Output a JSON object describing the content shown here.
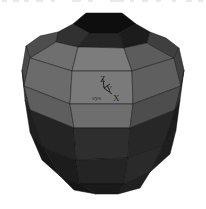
{
  "viewport": {
    "background_color": "#ffffff",
    "width": 206,
    "height": 209,
    "render_mode": "shaded-faceted"
  },
  "model": {
    "name": "geodesic-polyhedron",
    "description": "Faceted grayscale sphere / geodesic polyhedron",
    "center_x": 103,
    "center_y": 102,
    "radius_x": 82,
    "radius_y": 93,
    "shading": {
      "top_cap": "#151515",
      "upper_dark": "#2b2b2b",
      "upper_mid": "#4a4a4a",
      "bright_band": "#7d7d7d",
      "mid_band": "#6a6a6a",
      "left_shade": "#4f4f4f",
      "right_shade": "#555555",
      "lower_dark": "#262626",
      "bottom": "#1b1b1b",
      "edge_color": "#0d0d0d"
    }
  },
  "axis_triad": {
    "origin_x": 104,
    "origin_y": 88,
    "axes": [
      {
        "name": "z-axis",
        "label": "Z",
        "color": "#101010"
      },
      {
        "name": "y-axis",
        "label": "Y",
        "color": "#101010"
      },
      {
        "name": "x-axis",
        "label": "X",
        "color": "#101010"
      }
    ],
    "system_label": "sys"
  },
  "artifacts": {
    "top_strip_marks": [
      {
        "x": 2,
        "w": 5
      },
      {
        "x": 13,
        "w": 6
      },
      {
        "x": 24,
        "w": 5
      },
      {
        "x": 36,
        "w": 7
      },
      {
        "x": 51,
        "w": 4
      },
      {
        "x": 72,
        "w": 9
      },
      {
        "x": 88,
        "w": 5
      },
      {
        "x": 110,
        "w": 14
      },
      {
        "x": 130,
        "w": 4
      },
      {
        "x": 142,
        "w": 6
      },
      {
        "x": 156,
        "w": 5
      },
      {
        "x": 172,
        "w": 4
      },
      {
        "x": 186,
        "w": 6
      },
      {
        "x": 198,
        "w": 5
      }
    ]
  }
}
